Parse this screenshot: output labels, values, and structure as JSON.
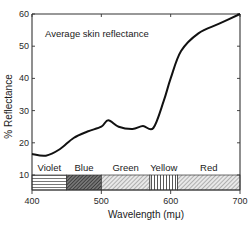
{
  "chart_data": {
    "type": "line",
    "title": "",
    "annotation": "Average skin reflectance",
    "xlabel": "Wavelength (mμ)",
    "ylabel": "% Reflectance",
    "xlim": [
      400,
      700
    ],
    "ylim": [
      10,
      60
    ],
    "x_ticks": [
      400,
      500,
      600,
      700
    ],
    "y_ticks": [
      10,
      20,
      30,
      40,
      50,
      60
    ],
    "grid": false,
    "legend": null,
    "series": [
      {
        "name": "Average skin reflectance",
        "x": [
          400,
          420,
          440,
          460,
          480,
          500,
          510,
          525,
          545,
          560,
          575,
          590,
          600,
          615,
          640,
          670,
          700
        ],
        "values": [
          16.5,
          16,
          18,
          21.5,
          23.5,
          25,
          27,
          25,
          24.3,
          25.2,
          24.6,
          33,
          40,
          48.5,
          54,
          57,
          60
        ]
      }
    ],
    "color_bands": [
      {
        "label": "Violet",
        "from": 400,
        "to": 450,
        "pattern": "horizontal-lines"
      },
      {
        "label": "Blue",
        "from": 450,
        "to": 500,
        "pattern": "dense-crosshatch"
      },
      {
        "label": "Green",
        "from": 500,
        "to": 570,
        "pattern": "diagonal-lines"
      },
      {
        "label": "Yellow",
        "from": 570,
        "to": 610,
        "pattern": "vertical-lines"
      },
      {
        "label": "Red",
        "from": 610,
        "to": 700,
        "pattern": "diagonal-lines"
      }
    ],
    "colors": {
      "line": "#111111",
      "axis": "#333333",
      "band_fill": "#ffffff"
    }
  }
}
